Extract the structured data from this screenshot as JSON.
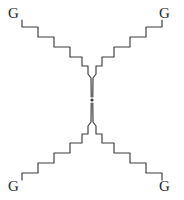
{
  "figure": {
    "background_color": "#ffffff",
    "width": 184,
    "height": 200
  },
  "style": {
    "chain_stroke_color": "#3a3a3a",
    "chain_stroke_width": 1.15,
    "label_color": "#262626",
    "label_font_size": 15,
    "core_color": "#3a3a3a"
  },
  "core": {
    "label": "",
    "x": 92,
    "y": 100,
    "radius": 1.6
  },
  "end_groups": [
    {
      "id": "top-left",
      "label": "G",
      "x": 8,
      "y": 6
    },
    {
      "id": "top-right",
      "label": "G",
      "x": 159,
      "y": 6
    },
    {
      "id": "bottom-left",
      "label": "G",
      "x": 8,
      "y": 179
    },
    {
      "id": "bottom-right",
      "label": "G",
      "x": 159,
      "y": 179
    }
  ],
  "arms": [
    {
      "id": "arm-top-left",
      "end_group": "G",
      "direction": "up-left",
      "steps": 5,
      "path": "M 22,20 L 22,27 L 38,27 L 38,37 L 54,37 L 54,47 L 70,47 L 70,57 L 82,57 L 82,66 L 88,66 L 88,74 L 91,78 L 91.2,97"
    },
    {
      "id": "arm-top-right",
      "end_group": "G",
      "direction": "up-right",
      "steps": 5,
      "path": "M 162,20 L 162,27 L 146,27 L 146,37 L 130,37 L 130,47 L 114,47 L 114,57 L 102,57 L 102,66 L 96,66 L 96,74 L 93,78 L 92.8,97"
    },
    {
      "id": "arm-bottom-left",
      "end_group": "G",
      "direction": "down-left",
      "steps": 5,
      "path": "M 22,180 L 22,173 L 38,173 L 38,163 L 54,163 L 54,153 L 70,153 L 70,143 L 82,143 L 82,134 L 88,134 L 88,126 L 91,122 L 91.2,103"
    },
    {
      "id": "arm-bottom-right",
      "end_group": "G",
      "direction": "down-right",
      "steps": 5,
      "path": "M 162,180 L 162,173 L 146,173 L 146,163 L 130,163 L 130,153 L 114,153 L 114,143 L 102,143 L 102,134 L 96,134 L 96,126 L 93,122 L 92.8,103"
    }
  ]
}
